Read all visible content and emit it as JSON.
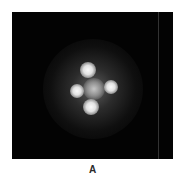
{
  "figure": {
    "panel_label": "A",
    "background_color": "#030303",
    "image_type": "diffraction-pattern",
    "spots": [
      {
        "name": "top",
        "x": 76,
        "y": 58,
        "size": 16
      },
      {
        "name": "left",
        "x": 65,
        "y": 79,
        "size": 14
      },
      {
        "name": "right",
        "x": 99,
        "y": 75,
        "size": 14
      },
      {
        "name": "bottom",
        "x": 79,
        "y": 95,
        "size": 16
      },
      {
        "name": "center",
        "x": 82,
        "y": 77,
        "size": 22
      }
    ],
    "streak_x": 146
  }
}
